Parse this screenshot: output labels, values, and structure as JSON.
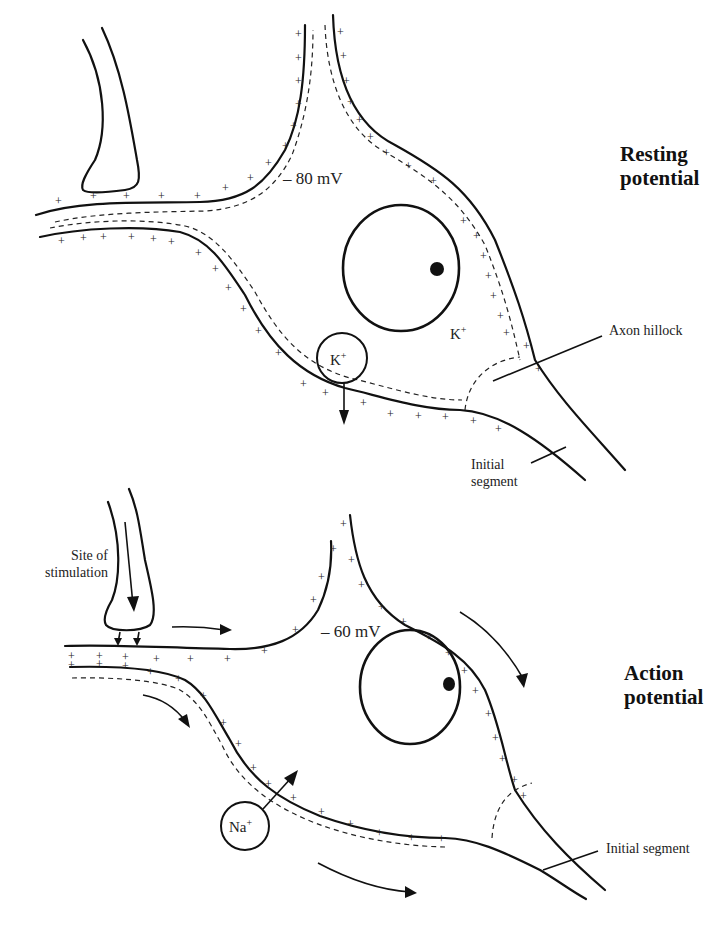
{
  "panels": [
    {
      "id": "resting",
      "title_line1": "Resting",
      "title_line2": "potential",
      "voltage": "– 80 mV",
      "ion_inside": "K",
      "ion_inside_charge": "+",
      "ion_channel": "K",
      "ion_channel_charge": "+",
      "labels": {
        "axon_hillock": "Axon hillock",
        "initial_segment_line1": "Initial",
        "initial_segment_line2": "segment"
      }
    },
    {
      "id": "action",
      "title_line1": "Action",
      "title_line2": "potential",
      "voltage": "– 60 mV",
      "ion_channel": "Na",
      "ion_channel_charge": "+",
      "labels": {
        "site_line1": "Site of",
        "site_line2": "stimulation",
        "initial_segment": "Initial segment"
      }
    }
  ],
  "symbols": {
    "plus": "+",
    "minus": "–"
  },
  "colors": {
    "ink": "#111111",
    "background": "#ffffff"
  }
}
